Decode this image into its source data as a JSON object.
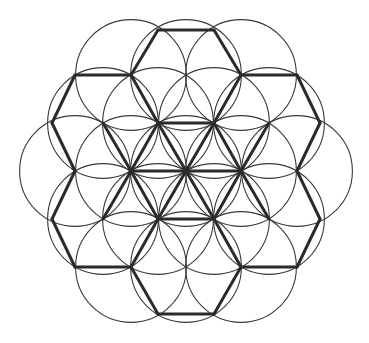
{
  "figure": {
    "name": "flower-of-life-hexagonal-lattice",
    "canvas": {
      "width": 369,
      "height": 343,
      "background": "#ffffff"
    },
    "center": {
      "x": 186,
      "y": 171
    },
    "geometry": {
      "lattice_type": "triangular",
      "node_spacing_x": 55.4,
      "node_spacing_y": 48.0,
      "circle_radius": 55.4,
      "circle_count": 19,
      "rings": 2,
      "description": "19 overlapping circles in hexagonal close packing, radius equal to center spacing"
    },
    "styles": {
      "circle_stroke": "#3a3a3a",
      "circle_stroke_width": 1.1,
      "circle_fill": "none",
      "lattice_stroke": "#2b2b2b",
      "lattice_stroke_width": 3.0
    },
    "circle_centers": [
      {
        "id": "c-center",
        "cx": 186,
        "cy": 171
      },
      {
        "id": "r1-e",
        "cx": 241,
        "cy": 171
      },
      {
        "id": "r1-ne",
        "cx": 214,
        "cy": 123
      },
      {
        "id": "r1-nw",
        "cx": 158,
        "cy": 123
      },
      {
        "id": "r1-w",
        "cx": 131,
        "cy": 171
      },
      {
        "id": "r1-sw",
        "cx": 158,
        "cy": 219
      },
      {
        "id": "r1-se",
        "cx": 214,
        "cy": 219
      },
      {
        "id": "r2-e",
        "cx": 297,
        "cy": 171
      },
      {
        "id": "r2-ene",
        "cx": 269,
        "cy": 123
      },
      {
        "id": "r2-ne",
        "cx": 241,
        "cy": 75
      },
      {
        "id": "r2-nne",
        "cx": 186,
        "cy": 75
      },
      {
        "id": "r2-nnw",
        "cx": 131,
        "cy": 75
      },
      {
        "id": "r2-nw",
        "cx": 103,
        "cy": 123
      },
      {
        "id": "r2-wnw",
        "cx": 75,
        "cy": 171
      },
      {
        "id": "r2-wsw",
        "cx": 103,
        "cy": 219
      },
      {
        "id": "r2-sw",
        "cx": 131,
        "cy": 267
      },
      {
        "id": "r2-ssw",
        "cx": 186,
        "cy": 267
      },
      {
        "id": "r2-sse",
        "cx": 241,
        "cy": 267
      },
      {
        "id": "r2-se",
        "cx": 269,
        "cy": 219
      }
    ],
    "lattice_nodes": [
      {
        "id": "n-top-l",
        "x": 158,
        "y": 30
      },
      {
        "id": "n-top-r",
        "x": 214,
        "y": 30
      },
      {
        "id": "n-unw",
        "x": 131,
        "y": 75
      },
      {
        "id": "n-un",
        "x": 186,
        "y": 75
      },
      {
        "id": "n-une",
        "x": 241,
        "y": 75
      },
      {
        "id": "n-uuw",
        "x": 75,
        "y": 75
      },
      {
        "id": "n-uue",
        "x": 297,
        "y": 75
      },
      {
        "id": "n-mwn",
        "x": 103,
        "y": 123
      },
      {
        "id": "n-cnw",
        "x": 158,
        "y": 123
      },
      {
        "id": "n-cne",
        "x": 214,
        "y": 123
      },
      {
        "id": "n-men",
        "x": 269,
        "y": 123
      },
      {
        "id": "n-lw",
        "x": 52,
        "y": 123
      },
      {
        "id": "n-le",
        "x": 320,
        "y": 123
      },
      {
        "id": "n-mw2",
        "x": 75,
        "y": 171
      },
      {
        "id": "n-mw",
        "x": 131,
        "y": 171
      },
      {
        "id": "n-mc",
        "x": 186,
        "y": 171
      },
      {
        "id": "n-me",
        "x": 241,
        "y": 171
      },
      {
        "id": "n-me2",
        "x": 297,
        "y": 171
      },
      {
        "id": "n-llw",
        "x": 52,
        "y": 219
      },
      {
        "id": "n-lle",
        "x": 320,
        "y": 219
      },
      {
        "id": "n-swn",
        "x": 103,
        "y": 219
      },
      {
        "id": "n-csw",
        "x": 158,
        "y": 219
      },
      {
        "id": "n-cse",
        "x": 214,
        "y": 219
      },
      {
        "id": "n-sen",
        "x": 269,
        "y": 219
      },
      {
        "id": "n-bw",
        "x": 75,
        "y": 267
      },
      {
        "id": "n-bsw",
        "x": 131,
        "y": 267
      },
      {
        "id": "n-bs",
        "x": 186,
        "y": 267
      },
      {
        "id": "n-bse",
        "x": 241,
        "y": 267
      },
      {
        "id": "n-be",
        "x": 297,
        "y": 267
      },
      {
        "id": "n-bot-l",
        "x": 158,
        "y": 314
      },
      {
        "id": "n-bot-r",
        "x": 214,
        "y": 314
      }
    ],
    "lattice_edges": [
      {
        "x1": 158,
        "y1": 30,
        "x2": 214,
        "y2": 30
      },
      {
        "x1": 158,
        "y1": 30,
        "x2": 131,
        "y2": 75
      },
      {
        "x1": 214,
        "y1": 30,
        "x2": 241,
        "y2": 75
      },
      {
        "x1": 131,
        "y1": 75,
        "x2": 75,
        "y2": 75
      },
      {
        "x1": 241,
        "y1": 75,
        "x2": 297,
        "y2": 75
      },
      {
        "x1": 131,
        "y1": 75,
        "x2": 158,
        "y2": 123
      },
      {
        "x1": 241,
        "y1": 75,
        "x2": 214,
        "y2": 123
      },
      {
        "x1": 75,
        "y1": 75,
        "x2": 52,
        "y2": 123
      },
      {
        "x1": 297,
        "y1": 75,
        "x2": 320,
        "y2": 123
      },
      {
        "x1": 158,
        "y1": 123,
        "x2": 214,
        "y2": 123
      },
      {
        "x1": 52,
        "y1": 123,
        "x2": 75,
        "y2": 171
      },
      {
        "x1": 320,
        "y1": 123,
        "x2": 297,
        "y2": 171
      },
      {
        "x1": 158,
        "y1": 123,
        "x2": 131,
        "y2": 171
      },
      {
        "x1": 214,
        "y1": 123,
        "x2": 241,
        "y2": 171
      },
      {
        "x1": 158,
        "y1": 123,
        "x2": 186,
        "y2": 171
      },
      {
        "x1": 214,
        "y1": 123,
        "x2": 186,
        "y2": 171
      },
      {
        "x1": 131,
        "y1": 171,
        "x2": 186,
        "y2": 171
      },
      {
        "x1": 186,
        "y1": 171,
        "x2": 241,
        "y2": 171
      },
      {
        "x1": 75,
        "y1": 171,
        "x2": 52,
        "y2": 219
      },
      {
        "x1": 297,
        "y1": 171,
        "x2": 320,
        "y2": 219
      },
      {
        "x1": 131,
        "y1": 171,
        "x2": 158,
        "y2": 219
      },
      {
        "x1": 241,
        "y1": 171,
        "x2": 214,
        "y2": 219
      },
      {
        "x1": 186,
        "y1": 171,
        "x2": 158,
        "y2": 219
      },
      {
        "x1": 186,
        "y1": 171,
        "x2": 214,
        "y2": 219
      },
      {
        "x1": 158,
        "y1": 219,
        "x2": 214,
        "y2": 219
      },
      {
        "x1": 52,
        "y1": 219,
        "x2": 75,
        "y2": 267
      },
      {
        "x1": 320,
        "y1": 219,
        "x2": 297,
        "y2": 267
      },
      {
        "x1": 75,
        "y1": 267,
        "x2": 131,
        "y2": 267
      },
      {
        "x1": 297,
        "y1": 267,
        "x2": 241,
        "y2": 267
      },
      {
        "x1": 158,
        "y1": 219,
        "x2": 131,
        "y2": 267
      },
      {
        "x1": 214,
        "y1": 219,
        "x2": 241,
        "y2": 267
      },
      {
        "x1": 131,
        "y1": 267,
        "x2": 158,
        "y2": 314
      },
      {
        "x1": 241,
        "y1": 267,
        "x2": 214,
        "y2": 314
      },
      {
        "x1": 158,
        "y1": 314,
        "x2": 214,
        "y2": 314
      },
      {
        "x1": 103,
        "y1": 123,
        "x2": 131,
        "y2": 171
      },
      {
        "x1": 269,
        "y1": 123,
        "x2": 241,
        "y2": 171
      },
      {
        "x1": 103,
        "y1": 219,
        "x2": 131,
        "y2": 171
      },
      {
        "x1": 269,
        "y1": 219,
        "x2": 241,
        "y2": 171
      }
    ]
  }
}
